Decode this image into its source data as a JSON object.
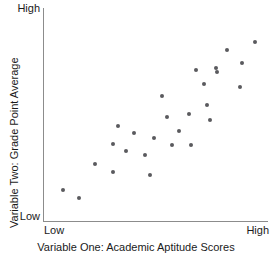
{
  "chart_data": {
    "type": "scatter",
    "title": "",
    "xlabel": "Variable One: Academic Aptitude Scores",
    "ylabel": "Variable Two: Grade Point Average",
    "x_tick_labels": [
      "Low",
      "High"
    ],
    "y_tick_labels": [
      "Low",
      "High"
    ],
    "xlim": [
      0,
      1
    ],
    "ylim": [
      0,
      1
    ],
    "grid": false,
    "legend": "none",
    "point_color": "#5a5a5e",
    "axis_color": "#8c8c8c",
    "annotation": "Positive correlation between academic aptitude scores and grade point average",
    "n_points": 27,
    "points": [
      {
        "x": 0.089,
        "y": 0.15
      },
      {
        "x": 0.16,
        "y": 0.112
      },
      {
        "x": 0.231,
        "y": 0.271
      },
      {
        "x": 0.311,
        "y": 0.365
      },
      {
        "x": 0.311,
        "y": 0.234
      },
      {
        "x": 0.333,
        "y": 0.449
      },
      {
        "x": 0.369,
        "y": 0.332
      },
      {
        "x": 0.404,
        "y": 0.416
      },
      {
        "x": 0.453,
        "y": 0.313
      },
      {
        "x": 0.476,
        "y": 0.22
      },
      {
        "x": 0.493,
        "y": 0.393
      },
      {
        "x": 0.529,
        "y": 0.589
      },
      {
        "x": 0.551,
        "y": 0.491
      },
      {
        "x": 0.573,
        "y": 0.36
      },
      {
        "x": 0.604,
        "y": 0.425
      },
      {
        "x": 0.649,
        "y": 0.505
      },
      {
        "x": 0.658,
        "y": 0.36
      },
      {
        "x": 0.68,
        "y": 0.71
      },
      {
        "x": 0.729,
        "y": 0.547
      },
      {
        "x": 0.716,
        "y": 0.645
      },
      {
        "x": 0.742,
        "y": 0.477
      },
      {
        "x": 0.773,
        "y": 0.701
      },
      {
        "x": 0.818,
        "y": 0.803
      },
      {
        "x": 0.884,
        "y": 0.743
      },
      {
        "x": 0.769,
        "y": 0.72
      },
      {
        "x": 0.876,
        "y": 0.631
      },
      {
        "x": 0.942,
        "y": 0.841
      }
    ]
  },
  "axis": {
    "y_high_label": "High",
    "y_low_label": "Low",
    "x_low_label": "Low",
    "x_high_label": "High",
    "x_title": "Variable One: Academic Aptitude Scores",
    "y_title": "Variable Two: Grade Point Average"
  }
}
